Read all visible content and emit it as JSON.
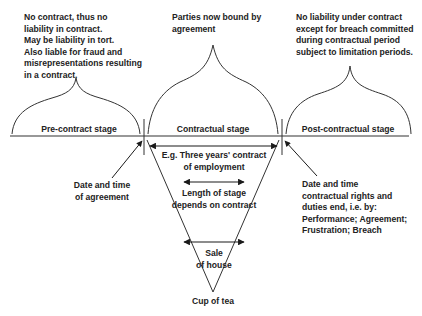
{
  "stages": {
    "pre": {
      "label": "Pre-contract stage",
      "note": [
        "No contract, thus no",
        "liability in contract.",
        "May be liability in tort.",
        "Also liable for fraud and",
        "misrepresentations resulting",
        "in a contract."
      ]
    },
    "contractual": {
      "label": "Contractual stage",
      "note": [
        "Parties now bound by",
        "agreement"
      ]
    },
    "post": {
      "label": "Post-contractual stage",
      "note": [
        "No liability under contract",
        "except for breach committed",
        "during contractual period",
        "subject to limitation periods."
      ]
    }
  },
  "annotations": {
    "start": [
      "Date and time",
      "of agreement"
    ],
    "end": [
      "Date and time",
      "contractual rights and",
      "duties end, i.e. by:",
      "Performance; Agreement;",
      "Frustration; Breach"
    ]
  },
  "examples": {
    "long": [
      "E.g. Three years' contract",
      "of employment"
    ],
    "middle": [
      "Length of stage",
      "depends on contract"
    ],
    "short": [
      "Sale",
      "of house"
    ],
    "shortest": "Cup of tea"
  },
  "colors": {
    "line": "#333333",
    "text": "#222222",
    "background": "#ffffff"
  }
}
